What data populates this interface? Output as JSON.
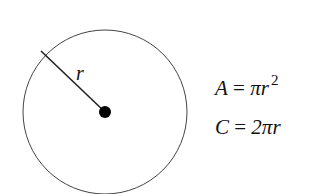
{
  "diagram": {
    "radius_label": "r",
    "formulas": {
      "area": {
        "lhs": "A",
        "eq": "=",
        "rhs": "πr",
        "exponent": "2"
      },
      "circumference": {
        "lhs": "C",
        "eq": "=",
        "rhs": "2πr"
      }
    },
    "colors": {
      "stroke": "#333333",
      "center_dot": "#000000",
      "background": "#ffffff"
    }
  }
}
